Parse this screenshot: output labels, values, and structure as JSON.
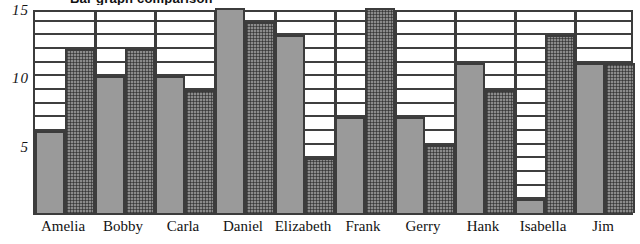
{
  "chart_data": {
    "type": "bar",
    "title": "Bar graph comparison",
    "xlabel": "",
    "ylabel": "",
    "ylim": [
      0,
      15
    ],
    "ytick_labels": [
      "5",
      "10",
      "15"
    ],
    "ytick_values": [
      5,
      10,
      15
    ],
    "grid": true,
    "grid_step": 1,
    "legend_position": "none",
    "categories": [
      "Amelia",
      "Bobby",
      "Carla",
      "Daniel",
      "Elizabeth",
      "Frank",
      "Gerry",
      "Hank",
      "Isabella",
      "Jim"
    ],
    "series": [
      {
        "name": "Series 1",
        "fill": "solid-grey",
        "color": "#9a9a9a",
        "values": [
          6,
          10,
          10,
          15,
          13,
          7,
          7,
          11,
          1,
          11
        ]
      },
      {
        "name": "Series 2",
        "fill": "cross-hatch",
        "color": "#8b8b8b",
        "values": [
          12,
          12,
          9,
          14,
          4,
          15,
          5,
          9,
          13,
          11
        ]
      }
    ]
  },
  "axis_colors": {
    "frame": "#3c3c3c",
    "gridline": "#3f3f3f",
    "text": "#121212"
  }
}
